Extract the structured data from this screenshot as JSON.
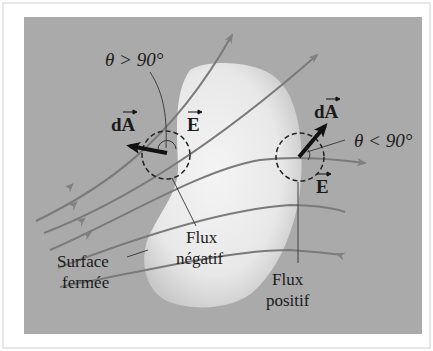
{
  "diagram": {
    "labels": {
      "theta_gt": "θ > 90°",
      "theta_lt": "θ < 90°",
      "dA_left": "dA",
      "dA_right": "dA",
      "E_left": "E",
      "E_right": "E",
      "flux_neg_1": "Flux",
      "flux_neg_2": "négatif",
      "flux_pos_1": "Flux",
      "flux_pos_2": "positif",
      "surface_1": "Surface",
      "surface_2": "fermée"
    },
    "colors": {
      "background": "#a9a9a9",
      "surface": "#ececec",
      "field_line": "#7a7a7a",
      "vector": "#111111"
    }
  }
}
